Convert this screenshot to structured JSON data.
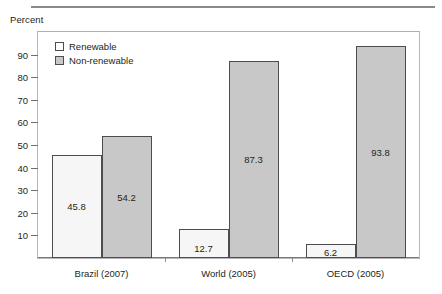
{
  "figure": {
    "axis_title": "Percent"
  },
  "legend": {
    "items": [
      {
        "label": "Renewable",
        "swatch": "renewable"
      },
      {
        "label": "Non-renewable",
        "swatch": "nonrenewable"
      }
    ]
  },
  "colors": {
    "renewable_fill": "#f6f6f6",
    "nonrenewable_fill": "#c8c8c8",
    "bar_border": "#4d4d51",
    "frame": "#b8b8bc",
    "top_rule": "#8a8a8f",
    "text": "#231f20"
  },
  "chart_data": {
    "type": "bar",
    "title": "",
    "xlabel": "",
    "ylabel": "Percent",
    "ylim": [
      0,
      100
    ],
    "yticks": [
      10,
      20,
      30,
      40,
      50,
      60,
      70,
      80,
      90
    ],
    "grid": false,
    "legend_position": "top-left-inside",
    "categories": [
      "Brazil (2007)",
      "World (2005)",
      "OECD (2005)"
    ],
    "series": [
      {
        "name": "Renewable",
        "values": [
          45.8,
          12.7,
          6.2
        ]
      },
      {
        "name": "Non-renewable",
        "values": [
          54.2,
          87.3,
          93.8
        ]
      }
    ],
    "value_labels": [
      [
        "45.8",
        "54.2"
      ],
      [
        "12.7",
        "87.3"
      ],
      [
        "6.2",
        "93.8"
      ]
    ]
  }
}
